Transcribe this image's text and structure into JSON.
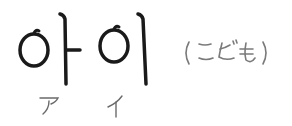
{
  "word": {
    "korean": "아이",
    "syllables": [
      "아",
      "이"
    ],
    "meaning_ja": "（こども）",
    "reading_katakana": [
      "ア",
      "イ"
    ]
  },
  "colors": {
    "korean_ink": "#1a1a1a",
    "meaning_ink": "#7a7a7a",
    "reading_ink": "#6a6a6a",
    "background": "#ffffff"
  }
}
